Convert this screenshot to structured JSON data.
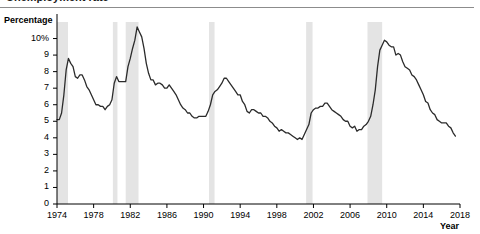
{
  "figure": {
    "title_partial": "Unemployment rate",
    "background": "#ffffff",
    "rule_color": "#8c8c8c"
  },
  "axes": {
    "ylabel": "Percentage",
    "xlabel": "Year",
    "axis_color": "#000000"
  },
  "chart_data": {
    "type": "line",
    "title": "Unemployment rate",
    "xlabel": "Year",
    "ylabel": "Percentage",
    "xlim": [
      1974,
      2018
    ],
    "ylim": [
      0,
      11
    ],
    "grid": false,
    "legend": "none",
    "line_color": "#2b2b2b",
    "line_width": 1.3,
    "ytick_labels": [
      "0",
      "1",
      "2",
      "3",
      "4",
      "5",
      "6",
      "7",
      "8",
      "9",
      "10%"
    ],
    "ytick_values": [
      0,
      1,
      2,
      3,
      4,
      5,
      6,
      7,
      8,
      9,
      10
    ],
    "xtick_labels": [
      "1974",
      "1978",
      "1982",
      "1986",
      "1990",
      "1994",
      "1998",
      "2002",
      "2006",
      "2010",
      "2014",
      "2018"
    ],
    "xtick_values": [
      1974,
      1978,
      1982,
      1986,
      1990,
      1994,
      1998,
      2002,
      2006,
      2010,
      2014,
      2018
    ],
    "shaded_band_color": "#e4e4e4",
    "shaded_band_label": "Recession",
    "shaded_bands": [
      {
        "start": 1974.0,
        "end": 1975.2
      },
      {
        "start": 1980.1,
        "end": 1980.6
      },
      {
        "start": 1981.5,
        "end": 1982.9
      },
      {
        "start": 1990.6,
        "end": 1991.2
      },
      {
        "start": 2001.2,
        "end": 2001.9
      },
      {
        "start": 2007.9,
        "end": 2009.5
      }
    ],
    "x": [
      1974.0,
      1974.25,
      1974.5,
      1974.75,
      1975.0,
      1975.25,
      1975.5,
      1975.75,
      1976.0,
      1976.25,
      1976.5,
      1976.75,
      1977.0,
      1977.25,
      1977.5,
      1977.75,
      1978.0,
      1978.25,
      1978.5,
      1978.75,
      1979.0,
      1979.25,
      1979.5,
      1979.75,
      1980.0,
      1980.25,
      1980.5,
      1980.75,
      1981.0,
      1981.25,
      1981.5,
      1981.75,
      1982.0,
      1982.25,
      1982.5,
      1982.75,
      1983.0,
      1983.25,
      1983.5,
      1983.75,
      1984.0,
      1984.25,
      1984.5,
      1984.75,
      1985.0,
      1985.25,
      1985.5,
      1985.75,
      1986.0,
      1986.25,
      1986.5,
      1986.75,
      1987.0,
      1987.25,
      1987.5,
      1987.75,
      1988.0,
      1988.25,
      1988.5,
      1988.75,
      1989.0,
      1989.25,
      1989.5,
      1989.75,
      1990.0,
      1990.25,
      1990.5,
      1990.75,
      1991.0,
      1991.25,
      1991.5,
      1991.75,
      1992.0,
      1992.25,
      1992.5,
      1992.75,
      1993.0,
      1993.25,
      1993.5,
      1993.75,
      1994.0,
      1994.25,
      1994.5,
      1994.75,
      1995.0,
      1995.25,
      1995.5,
      1995.75,
      1996.0,
      1996.25,
      1996.5,
      1996.75,
      1997.0,
      1997.25,
      1997.5,
      1997.75,
      1998.0,
      1998.25,
      1998.5,
      1998.75,
      1999.0,
      1999.25,
      1999.5,
      1999.75,
      2000.0,
      2000.25,
      2000.5,
      2000.75,
      2001.0,
      2001.25,
      2001.5,
      2001.75,
      2002.0,
      2002.25,
      2002.5,
      2002.75,
      2003.0,
      2003.25,
      2003.5,
      2003.75,
      2004.0,
      2004.25,
      2004.5,
      2004.75,
      2005.0,
      2005.25,
      2005.5,
      2005.75,
      2006.0,
      2006.25,
      2006.5,
      2006.75,
      2007.0,
      2007.25,
      2007.5,
      2007.75,
      2008.0,
      2008.25,
      2008.5,
      2008.75,
      2009.0,
      2009.25,
      2009.5,
      2009.75,
      2010.0,
      2010.25,
      2010.5,
      2010.75,
      2011.0,
      2011.25,
      2011.5,
      2011.75,
      2012.0,
      2012.25,
      2012.5,
      2012.75,
      2013.0,
      2013.25,
      2013.5,
      2013.75,
      2014.0,
      2014.25,
      2014.5,
      2014.75,
      2015.0,
      2015.25,
      2015.5,
      2015.75,
      2016.0,
      2016.25,
      2016.5,
      2016.75,
      2017.0,
      2017.25,
      2017.5
    ],
    "values": [
      5.1,
      5.1,
      5.5,
      6.6,
      8.1,
      8.8,
      8.5,
      8.3,
      7.7,
      7.6,
      7.8,
      7.8,
      7.5,
      7.1,
      6.9,
      6.6,
      6.3,
      6.0,
      6.0,
      5.9,
      5.9,
      5.7,
      5.9,
      6.0,
      6.3,
      7.3,
      7.7,
      7.4,
      7.4,
      7.4,
      7.4,
      8.3,
      8.8,
      9.4,
      9.9,
      10.7,
      10.4,
      10.1,
      9.4,
      8.5,
      7.9,
      7.5,
      7.5,
      7.2,
      7.3,
      7.3,
      7.2,
      7.0,
      7.0,
      7.2,
      7.0,
      6.8,
      6.6,
      6.3,
      6.0,
      5.8,
      5.7,
      5.5,
      5.5,
      5.3,
      5.2,
      5.2,
      5.3,
      5.3,
      5.3,
      5.3,
      5.6,
      6.0,
      6.6,
      6.8,
      6.9,
      7.1,
      7.3,
      7.6,
      7.6,
      7.4,
      7.2,
      7.0,
      6.8,
      6.6,
      6.6,
      6.2,
      6.0,
      5.6,
      5.5,
      5.7,
      5.7,
      5.6,
      5.5,
      5.5,
      5.3,
      5.3,
      5.2,
      5.0,
      4.9,
      4.7,
      4.6,
      4.4,
      4.5,
      4.4,
      4.3,
      4.3,
      4.2,
      4.1,
      4.0,
      3.9,
      4.0,
      3.9,
      4.2,
      4.5,
      4.8,
      5.5,
      5.7,
      5.8,
      5.8,
      5.9,
      5.9,
      6.1,
      6.1,
      5.9,
      5.7,
      5.6,
      5.5,
      5.4,
      5.3,
      5.1,
      5.0,
      5.0,
      4.7,
      4.6,
      4.7,
      4.4,
      4.5,
      4.5,
      4.7,
      4.8,
      5.0,
      5.3,
      6.0,
      6.9,
      8.3,
      9.3,
      9.6,
      9.9,
      9.8,
      9.6,
      9.5,
      9.5,
      9.0,
      9.1,
      9.0,
      8.6,
      8.3,
      8.2,
      8.1,
      7.8,
      7.7,
      7.5,
      7.2,
      6.9,
      6.6,
      6.2,
      6.1,
      5.7,
      5.5,
      5.4,
      5.1,
      5.0,
      4.9,
      4.9,
      4.9,
      4.7,
      4.6,
      4.3,
      4.1
    ]
  }
}
